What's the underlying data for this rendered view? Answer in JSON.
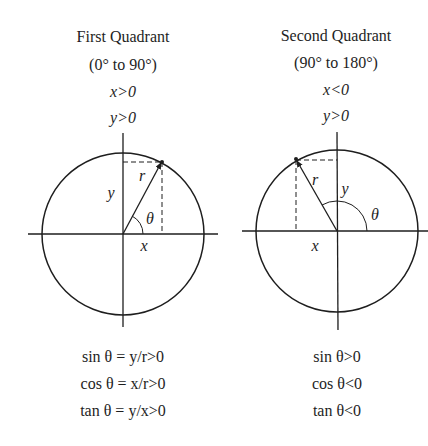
{
  "panels": [
    {
      "title": "First Quadrant",
      "range": "(0° to 90°)",
      "x_condition": "x>0",
      "y_condition": "y>0",
      "labels": {
        "r": "r",
        "y": "y",
        "x": "x",
        "theta": "θ"
      },
      "equations": [
        "sin θ = y/r>0",
        "cos θ = x/r>0",
        "tan θ = y/x>0"
      ]
    },
    {
      "title": "Second Quadrant",
      "range": "(90° to 180°)",
      "x_condition": "x<0",
      "y_condition": "y>0",
      "labels": {
        "r": "r",
        "y": "y",
        "x": "x",
        "theta": "θ"
      },
      "equations": [
        "sin θ>0",
        "cos θ<0",
        "tan θ<0"
      ]
    }
  ],
  "colors": {
    "line": "#1e1e1e",
    "background": "#ffffff"
  }
}
